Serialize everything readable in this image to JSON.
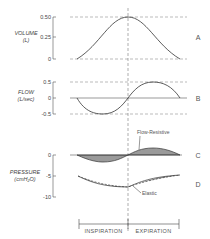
{
  "panels": {
    "volume": {
      "label_line1": "VOLUME",
      "label_line2": "(L)",
      "ticks": [
        "0.50",
        "0.25",
        "0"
      ],
      "letter": "A"
    },
    "flow": {
      "label_line1": "FLOW",
      "label_line2": "(L/sec)",
      "ticks": [
        "0.5",
        "0",
        "-0.5"
      ],
      "letter": "B"
    },
    "pressure": {
      "label_line1": "PRESSURE",
      "label_line2": "(cmH₂O)",
      "ticks": [
        "0",
        "-5",
        "-10"
      ],
      "letter_c": "C",
      "letter_d": "D",
      "annotation_flow_resistive": "Flow-Resistive",
      "annotation_elastic": "Elastic"
    }
  },
  "phases": {
    "inspiration": "INSPIRATION",
    "expiration": "EXPIRATION"
  },
  "colors": {
    "line": "#444444",
    "dash": "#777777",
    "fill": "#9a9a9a"
  }
}
